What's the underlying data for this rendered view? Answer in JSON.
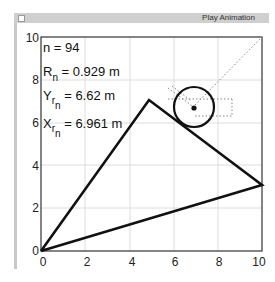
{
  "window": {
    "play_button_label": "Play Animation"
  },
  "stats": {
    "n": "n = 94",
    "R_main": "R",
    "R_sub": "n",
    "R_val": " = 0.929 m",
    "Y_main": "Y",
    "Y_sub1": "r",
    "Y_sub2": "n",
    "Y_val": " = 6.62 m",
    "X_main": "X",
    "X_sub1": "r",
    "X_sub2": "n",
    "X_val": " = 6.961 m"
  },
  "axes": {
    "x_ticks": [
      "0",
      "2",
      "4",
      "6",
      "8",
      "10"
    ],
    "y_ticks": [
      "0",
      "2",
      "4",
      "6",
      "8",
      "10"
    ]
  },
  "colors": {
    "line": "#111111",
    "grid": "#dddddd",
    "dotted": "#888888",
    "titlebar": "#cfcfcf"
  }
}
